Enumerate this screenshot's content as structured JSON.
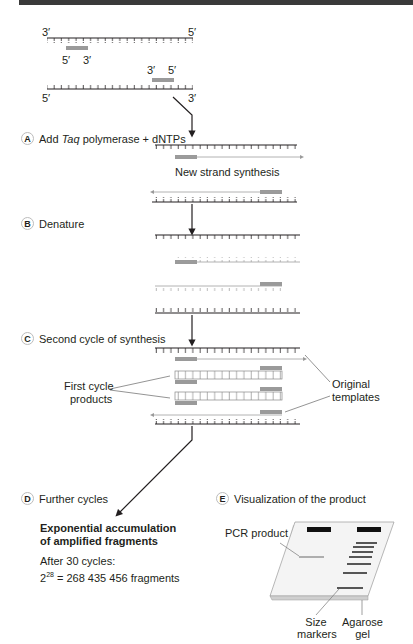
{
  "header_bar": {
    "color": "#3a3a3a"
  },
  "strand_labels": {
    "top_left": "3′",
    "top_right": "5′",
    "primer1_left": "5′",
    "primer1_right": "3′",
    "primer2_left": "3′",
    "primer2_right": "5′",
    "bottom_left": "5′",
    "bottom_right": "3′"
  },
  "steps": [
    {
      "letter": "A",
      "label_pre": "Add ",
      "label_italic": "Taq",
      "label_post": " polymerase + dNTPs"
    },
    {
      "letter": "B",
      "label": "Denature"
    },
    {
      "letter": "C",
      "label": "Second cycle of synthesis"
    },
    {
      "letter": "D",
      "label": "Further cycles"
    },
    {
      "letter": "E",
      "label": "Visualization of the product"
    }
  ],
  "annotations": {
    "new_strand": "New strand synthesis",
    "first_cycle_line1": "First cycle",
    "first_cycle_line2": "products",
    "original_line1": "Original",
    "original_line2": "templates"
  },
  "result": {
    "heading_line1": "Exponential accumulation",
    "heading_line2": "of amplified fragments",
    "after": "After 30 cycles:",
    "base": "2",
    "exponent": "28",
    "equation": " = 268 435 456 fragments"
  },
  "gel": {
    "pcr_product": "PCR product",
    "size_line1": "Size",
    "size_line2": "markers",
    "agarose_line1": "Agarose",
    "agarose_line2": "gel"
  },
  "colors": {
    "strand": "#231f20",
    "primer": "#9a9a9a",
    "new_strand": "#a0a0a0",
    "gel": "#f2f2f2"
  }
}
